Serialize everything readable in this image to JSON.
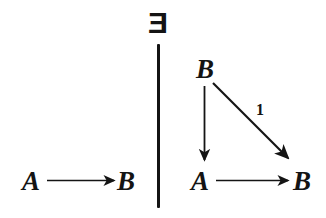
{
  "figure": {
    "width": 326,
    "height": 218,
    "background_color": "#ffffff",
    "ink_color": "#141414"
  },
  "quantifier": {
    "symbol": "E",
    "meaning": "there-exists",
    "rendered_as": "reversed capital E"
  },
  "divider": {
    "orientation": "vertical",
    "label": "vertical-rule"
  },
  "left_diagram": {
    "name": "source-diagram",
    "objects": [
      {
        "id": "left-A",
        "label": "A"
      },
      {
        "id": "left-B",
        "label": "B"
      }
    ],
    "arrows": [
      {
        "id": "left-A-to-B",
        "from": "A",
        "to": "B",
        "label": "",
        "direction": "right"
      }
    ]
  },
  "right_diagram": {
    "name": "target-triangle-diagram",
    "objects": [
      {
        "id": "right-B-top",
        "label": "B"
      },
      {
        "id": "right-A-bottom",
        "label": "A"
      },
      {
        "id": "right-B-bottom",
        "label": "B"
      }
    ],
    "arrows": [
      {
        "id": "right-B-to-A",
        "from": "B",
        "to": "A",
        "label": "",
        "direction": "down"
      },
      {
        "id": "right-B-to-B-diagonal",
        "from": "B",
        "to": "B",
        "label": "1",
        "direction": "down-right"
      },
      {
        "id": "right-A-to-B",
        "from": "A",
        "to": "B",
        "label": "",
        "direction": "right"
      }
    ]
  }
}
